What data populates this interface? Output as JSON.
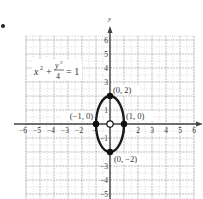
{
  "chart_data": {
    "type": "line",
    "title": "",
    "equation": {
      "lhs_x": "x",
      "x_exp": "2",
      "plus": "+",
      "frac_num": "y",
      "frac_num_exp": "2",
      "frac_den": "4",
      "eq": "= 1",
      "full": "x^2 + y^2/4 = 1"
    },
    "xlabel": "",
    "ylabel": "y",
    "xlim": [
      -6,
      6
    ],
    "ylim": [
      -5,
      6
    ],
    "grid": true,
    "x_ticks": [
      "−6",
      "−5",
      "−4",
      "−3",
      "−2",
      "1",
      "2",
      "3",
      "4",
      "5",
      "6"
    ],
    "y_ticks": [
      "6",
      "5",
      "4",
      "3",
      "1",
      "−1",
      "−3",
      "−4",
      "−5"
    ],
    "curve": {
      "kind": "ellipse",
      "center": [
        0,
        0
      ],
      "semi_axis_x": 1,
      "semi_axis_y": 2,
      "color": "#1a1a1a"
    },
    "points": [
      {
        "x": 0,
        "y": 2,
        "label": "(0, 2)",
        "filled": true
      },
      {
        "x": 0,
        "y": -2,
        "label": "(0, −2)",
        "filled": true
      },
      {
        "x": -1,
        "y": 0,
        "label": "(−1, 0)",
        "filled": true
      },
      {
        "x": 1,
        "y": 0,
        "label": "(1, 0)",
        "filled": true
      },
      {
        "x": 0,
        "y": 0,
        "label": "",
        "filled": false
      }
    ]
  }
}
